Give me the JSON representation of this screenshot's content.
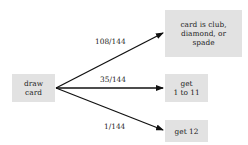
{
  "diagram": {
    "source": {
      "label": "draw\ncard"
    },
    "outcomes": [
      {
        "label": "card is club,\ndiamond, or\nspade",
        "probability": "108/144"
      },
      {
        "label": "get\n1 to 11",
        "probability": "35/144"
      },
      {
        "label": "get 12",
        "probability": "1/144"
      }
    ],
    "colors": {
      "box_fill": "#e2e2e2",
      "arrow": "#111111",
      "text": "#222222"
    }
  }
}
